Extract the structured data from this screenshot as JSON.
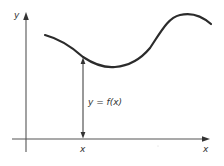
{
  "diagram": {
    "type": "function-graph",
    "labels": {
      "y_axis": "y",
      "x_axis": "x",
      "x_point": "x",
      "function_label": "y = f(x)"
    },
    "colors": {
      "background": "#ffffff",
      "axis": "#555555",
      "curve": "#2b2b2b",
      "text": "#333333"
    }
  }
}
